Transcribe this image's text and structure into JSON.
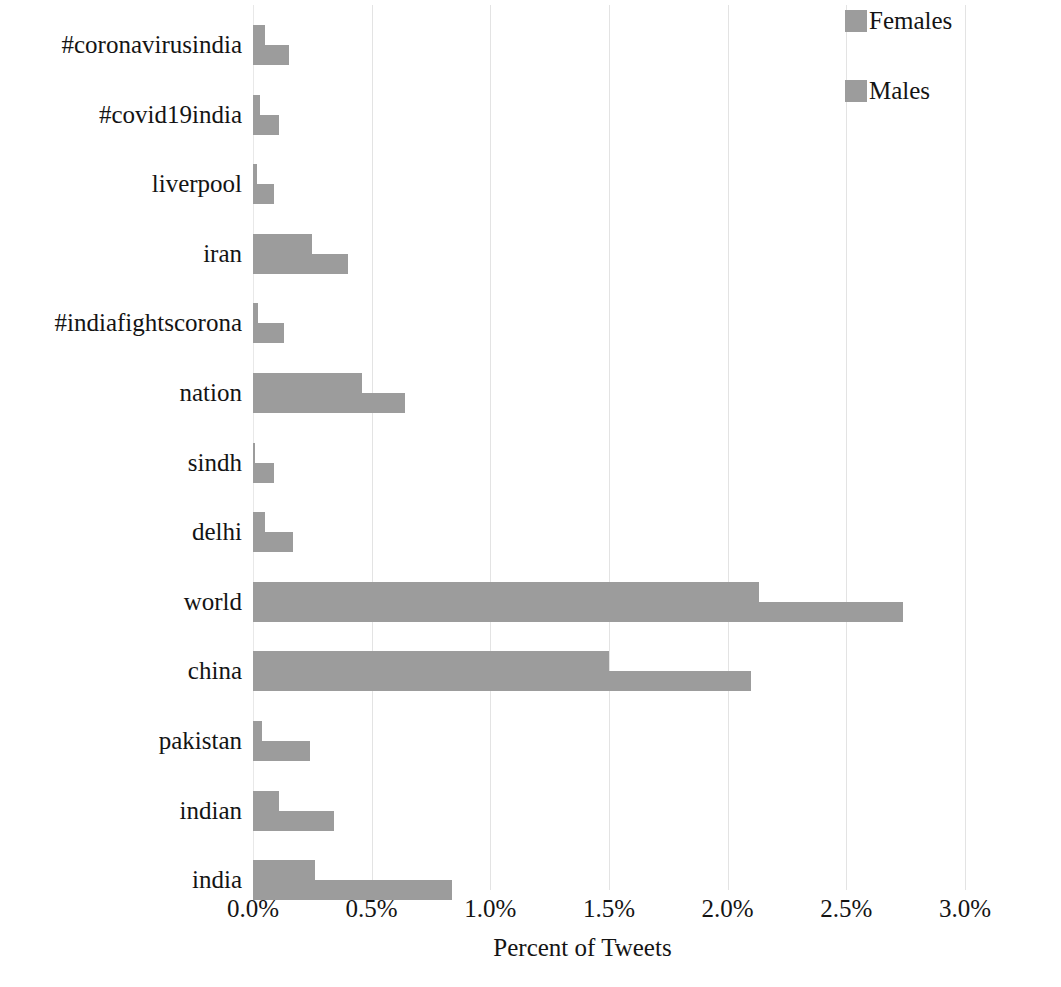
{
  "chart_data": {
    "type": "bar",
    "orientation": "horizontal",
    "title": "",
    "xlabel": "Percent of Tweets",
    "ylabel": "Term",
    "xlim": [
      0,
      3.0
    ],
    "xticks": [
      "0.0%",
      "0.5%",
      "1.0%",
      "1.5%",
      "2.0%",
      "2.5%",
      "3.0%"
    ],
    "xtick_values": [
      0.0,
      0.5,
      1.0,
      1.5,
      2.0,
      2.5,
      3.0
    ],
    "grid": true,
    "legend_position": "top-right",
    "categories": [
      "#coronavirusindia",
      "#covid19india",
      "liverpool",
      "iran",
      "#indiafightscorona",
      "nation",
      "sindh",
      "delhi",
      "world",
      "china",
      "pakistan",
      "indian",
      "india"
    ],
    "series": [
      {
        "name": "Females",
        "color": "#9c9c9c",
        "values": [
          0.05,
          0.03,
          0.015,
          0.25,
          0.02,
          0.46,
          0.01,
          0.05,
          2.13,
          1.5,
          0.04,
          0.11,
          0.26
        ]
      },
      {
        "name": "Males",
        "color": "#9c9c9c",
        "values": [
          0.15,
          0.11,
          0.09,
          0.4,
          0.13,
          0.64,
          0.09,
          0.17,
          2.74,
          2.1,
          0.24,
          0.34,
          0.84
        ]
      }
    ]
  },
  "legend": {
    "items": [
      {
        "label": "Females",
        "color": "#9c9c9c"
      },
      {
        "label": "Males",
        "color": "#9c9c9c"
      }
    ]
  },
  "axes": {
    "x_title": "Percent of Tweets",
    "y_title": "Term"
  },
  "colors": {
    "bar": "#9c9c9c",
    "gridline": "#e3e3e3",
    "text": "#141414",
    "background": "#ffffff"
  }
}
